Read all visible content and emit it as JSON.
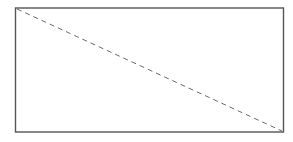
{
  "diagram": {
    "rectangle": {
      "x": 15.5,
      "y": 8,
      "width": 268,
      "height": 124,
      "stroke": "#555555",
      "stroke_width": 1.4
    },
    "diagonal": {
      "x1": 17,
      "y1": 9,
      "x2": 282,
      "y2": 131,
      "stroke": "#6a6a6a",
      "stroke_width": 1,
      "dash": "5,4"
    }
  }
}
